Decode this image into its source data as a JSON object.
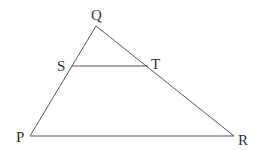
{
  "diagram": {
    "type": "triangle-with-parallel-segment",
    "colors": {
      "line": "#555555",
      "text": "#333333",
      "background": "#ffffff"
    },
    "points": {
      "Q": {
        "label": "Q",
        "x": 96,
        "y": 26
      },
      "P": {
        "label": "P",
        "x": 30,
        "y": 136
      },
      "R": {
        "label": "R",
        "x": 234,
        "y": 136
      },
      "S": {
        "label": "S",
        "x": 72,
        "y": 66
      },
      "T": {
        "label": "T",
        "x": 148,
        "y": 66
      }
    },
    "segments": [
      "QP",
      "QR",
      "PR",
      "ST"
    ]
  }
}
